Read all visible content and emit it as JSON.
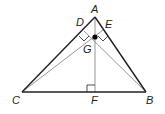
{
  "diagram": {
    "type": "geometry-triangle-altitudes",
    "colors": {
      "side": "#231f20",
      "altitude": "#8a8a8a",
      "point": "#000000",
      "background": "#ffffff"
    },
    "points": {
      "A": {
        "label": "A",
        "x": 95,
        "y": 17
      },
      "B": {
        "label": "B",
        "x": 146,
        "y": 92
      },
      "C": {
        "label": "C",
        "x": 22,
        "y": 92
      },
      "D": {
        "label": "D",
        "x": 84,
        "y": 31
      },
      "E": {
        "label": "E",
        "x": 103,
        "y": 30
      },
      "F": {
        "label": "F",
        "x": 95,
        "y": 92
      },
      "G": {
        "label": "G",
        "x": 95,
        "y": 37
      }
    },
    "segments": [
      {
        "from": "A",
        "to": "B",
        "kind": "side"
      },
      {
        "from": "B",
        "to": "C",
        "kind": "side"
      },
      {
        "from": "C",
        "to": "A",
        "kind": "side"
      },
      {
        "from": "A",
        "to": "F",
        "kind": "altitude"
      },
      {
        "from": "C",
        "to": "E",
        "kind": "altitude"
      },
      {
        "from": "B",
        "to": "D",
        "kind": "altitude"
      }
    ],
    "right_angle_marks": [
      "D",
      "E",
      "F"
    ],
    "highlighted_point": "G"
  }
}
